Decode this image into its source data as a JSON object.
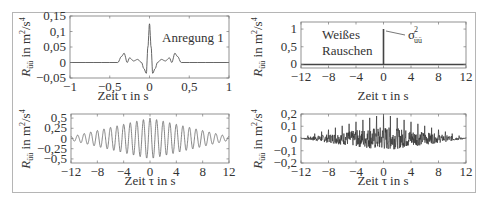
{
  "chart_data": [
    {
      "type": "line",
      "title": "",
      "annotation": "Anregung 1",
      "xlabel": "Zeit τ in s",
      "ylabel": "Rüü in m²/s⁴",
      "xlim": [
        -1,
        1
      ],
      "ylim": [
        -0.05,
        0.15
      ],
      "xticks": [
        "−1",
        "−0,5",
        "0",
        "0,5",
        "1"
      ],
      "yticks": [
        "0,15",
        "0,1",
        "0,05",
        "0",
        "−0,05"
      ],
      "series": [
        {
          "name": "Autokorrelation Anregung 1",
          "x": [
            -1,
            -0.4,
            -0.35,
            -0.32,
            -0.28,
            -0.25,
            -0.2,
            -0.15,
            -0.1,
            -0.07,
            -0.04,
            -0.02,
            0,
            0.02,
            0.04,
            0.07,
            0.1,
            0.15,
            0.2,
            0.25,
            0.28,
            0.32,
            0.35,
            0.4,
            1
          ],
          "y": [
            0,
            0,
            0.02,
            0.03,
            0.0,
            0.015,
            0.005,
            0.01,
            0.0,
            -0.02,
            -0.035,
            0.05,
            0.125,
            0.05,
            -0.035,
            -0.02,
            0.0,
            0.01,
            0.005,
            0.015,
            0.0,
            0.03,
            0.02,
            0,
            0
          ]
        }
      ]
    },
    {
      "type": "line",
      "annotation": "Weißes Rauschen",
      "annotation2": "σü²",
      "xlabel": "Zeit τ in s",
      "ylabel": "Rüü in m²/s⁴",
      "xlim": [
        -12,
        12
      ],
      "ylim": [
        -0.1,
        1.2
      ],
      "xticks": [
        "−12",
        "−8",
        "−4",
        "0",
        "4",
        "8",
        "12"
      ],
      "yticks": [
        "1",
        "0,5",
        "0"
      ],
      "series": [
        {
          "name": "Weißes Rauschen",
          "x": [
            -12,
            0,
            0,
            0,
            12
          ],
          "y": [
            0,
            0,
            1,
            0,
            0
          ]
        }
      ]
    },
    {
      "type": "line",
      "xlabel": "Zeit τ in s",
      "ylabel": "Rüü in m²/s⁴",
      "xlim": [
        -12,
        12
      ],
      "ylim": [
        -0.6,
        0.6
      ],
      "xticks": [
        "−12",
        "−8",
        "−4",
        "0",
        "4",
        "8",
        "12"
      ],
      "yticks": [
        "0,5",
        "0,25",
        "0",
        "−0,25",
        "−0,5"
      ],
      "series": [
        {
          "name": "Schwingung",
          "description": "Kosinus ca. 1 Hz, Dreieckshuellkurve, Amplitude 0,5 bei τ=0, ~0,05 bei |τ|=12",
          "peak": 0.5,
          "frequency_hz": 1.0
        }
      ]
    },
    {
      "type": "line",
      "xlabel": "Zeit τ in s",
      "ylabel": "Rüü in m²/s⁴",
      "xlim": [
        -12,
        12
      ],
      "ylim": [
        -0.2,
        0.2
      ],
      "xticks": [
        "−12",
        "−8",
        "−4",
        "0",
        "4",
        "8",
        "12"
      ],
      "yticks": [
        "0,2",
        "0,1",
        "0",
        "−0,1",
        "−0,2"
      ],
      "series": [
        {
          "name": "Rauschen + Periodisch",
          "description": "dichtes Band mit Spitzen im Abstand 1 s, Spitze 0,2 bei τ=0, Huellkurve nach aussen abnehmend",
          "peak": 0.2,
          "min": -0.12
        }
      ]
    }
  ]
}
